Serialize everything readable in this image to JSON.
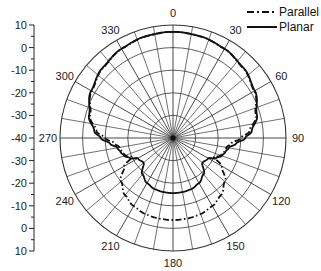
{
  "chart_data": {
    "type": "polar-line",
    "title": "",
    "radial_axis": {
      "label": "",
      "unit": "dB",
      "range": [
        -40,
        10
      ],
      "ticks": [
        10,
        0,
        -10,
        -20,
        -30,
        -40,
        -30,
        -20,
        -10,
        0,
        10
      ],
      "rings": [
        0,
        -10,
        -20,
        -30,
        10
      ]
    },
    "angular_axis": {
      "unit": "deg",
      "direction": "clockwise",
      "zero": "top",
      "labels": [
        "0",
        "30",
        "60",
        "90",
        "120",
        "150",
        "180",
        "210",
        "240",
        "270",
        "300",
        "330"
      ],
      "grid_step": 10
    },
    "legend": {
      "position": "top-right",
      "entries": [
        {
          "name": "Parallel",
          "style": "dash-dot"
        },
        {
          "name": "Planar",
          "style": "solid"
        }
      ]
    },
    "series": [
      {
        "name": "Parallel",
        "style": "dash-dot",
        "angles": [
          0,
          15,
          30,
          45,
          60,
          75,
          85,
          90,
          95,
          100,
          105,
          110,
          115,
          120,
          130,
          140,
          150,
          160,
          170,
          180,
          190,
          200,
          210,
          220,
          230,
          240,
          245,
          250,
          255,
          260,
          265,
          270,
          275,
          285,
          300,
          315,
          330,
          345,
          360
        ],
        "values": [
          7,
          6.6,
          5.5,
          3.8,
          1.5,
          -2,
          -6,
          -10,
          -14,
          -16,
          -16.5,
          -17.5,
          -20,
          -15,
          -10,
          -7,
          -5.2,
          -4.2,
          -3.8,
          -3.7,
          -3.8,
          -4.2,
          -5.2,
          -7,
          -10,
          -15,
          -20,
          -17.5,
          -16.5,
          -16,
          -14,
          -10,
          -6,
          -2,
          1.5,
          3.8,
          5.5,
          6.6,
          7
        ]
      },
      {
        "name": "Planar",
        "style": "solid",
        "angles": [
          0,
          15,
          30,
          45,
          60,
          75,
          85,
          90,
          95,
          100,
          105,
          110,
          115,
          120,
          130,
          140,
          150,
          160,
          170,
          180,
          190,
          200,
          210,
          220,
          230,
          240,
          245,
          250,
          255,
          260,
          265,
          270,
          275,
          285,
          300,
          315,
          330,
          345,
          360
        ],
        "values": [
          7,
          6.6,
          5.6,
          4,
          1.8,
          -1.5,
          -5,
          -8,
          -12,
          -15,
          -16,
          -17,
          -19,
          -22,
          -23,
          -19,
          -17,
          -16,
          -15.7,
          -15.6,
          -15.7,
          -16,
          -17,
          -19,
          -23,
          -22,
          -19,
          -17,
          -16,
          -15,
          -12,
          -8,
          -5,
          -1.5,
          1.8,
          4,
          5.6,
          6.6,
          7
        ]
      }
    ]
  }
}
